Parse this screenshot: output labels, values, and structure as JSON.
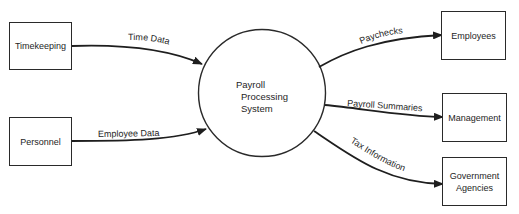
{
  "diagram": {
    "type": "data-flow-diagram",
    "process": {
      "lines": [
        "Payroll",
        "Processing",
        "System"
      ]
    },
    "sources": [
      {
        "id": "timekeeping",
        "label": "Timekeeping"
      },
      {
        "id": "personnel",
        "label": "Personnel"
      }
    ],
    "sinks": [
      {
        "id": "employees",
        "label": "Employees"
      },
      {
        "id": "management",
        "label": "Management"
      },
      {
        "id": "government",
        "lines": [
          "Government",
          "Agencies"
        ]
      }
    ],
    "flows": [
      {
        "from": "Timekeeping",
        "to": "Payroll Processing System",
        "label": "Time Data"
      },
      {
        "from": "Personnel",
        "to": "Payroll Processing System",
        "label": "Employee Data"
      },
      {
        "from": "Payroll Processing System",
        "to": "Employees",
        "label": "Paychecks"
      },
      {
        "from": "Payroll Processing System",
        "to": "Management",
        "label": "Payroll Summaries"
      },
      {
        "from": "Payroll Processing System",
        "to": "Government Agencies",
        "label": "Tax Information"
      }
    ]
  }
}
